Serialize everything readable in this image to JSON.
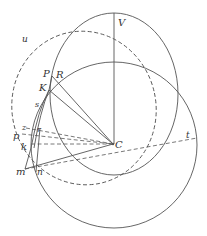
{
  "figure": {
    "type": "geometric-diagram",
    "colors": {
      "stroke": "#555555",
      "label": "#333333",
      "background": "#ffffff"
    }
  },
  "labels": {
    "V": "V",
    "P": "P",
    "R": "R",
    "K": "K",
    "s": "s",
    "u": "u",
    "z": "z",
    "r": "r",
    "p": "p",
    "k": "k",
    "m": "m",
    "n": "n",
    "C": "C",
    "t": "t"
  }
}
